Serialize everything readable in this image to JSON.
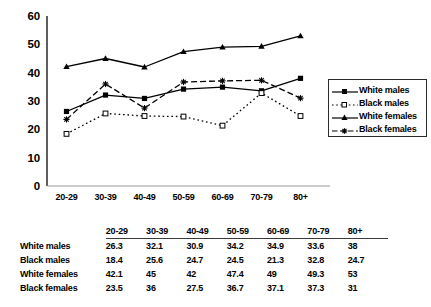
{
  "chart_data": {
    "type": "line",
    "title": "",
    "xlabel": "",
    "ylabel": "",
    "ylim": [
      0,
      60
    ],
    "yticks": [
      0,
      10,
      20,
      30,
      40,
      50,
      60
    ],
    "grid": false,
    "legend_position": "right",
    "categories": [
      "20-29",
      "30-39",
      "40-49",
      "50-59",
      "60-69",
      "70-79",
      "80+"
    ],
    "series": [
      {
        "name": "White males",
        "marker": "filled-square",
        "line_style": "solid",
        "values": [
          26.3,
          32.1,
          30.9,
          34.2,
          34.9,
          33.6,
          38
        ]
      },
      {
        "name": "Black males",
        "marker": "open-square",
        "line_style": "dotted",
        "values": [
          18.4,
          25.6,
          24.7,
          24.5,
          21.3,
          32.8,
          24.7
        ]
      },
      {
        "name": "White females",
        "marker": "filled-triangle",
        "line_style": "solid",
        "values": [
          42.1,
          45,
          42,
          47.4,
          49,
          49.3,
          53
        ]
      },
      {
        "name": "Black females",
        "marker": "star",
        "line_style": "dashed",
        "values": [
          23.5,
          36,
          27.5,
          36.7,
          37.1,
          37.3,
          31
        ]
      }
    ]
  },
  "legend": {
    "items": [
      {
        "label": "White males"
      },
      {
        "label": "Black males"
      },
      {
        "label": "White females"
      },
      {
        "label": "Black females"
      }
    ]
  },
  "table": {
    "corner_label": "",
    "columns": [
      "20-29",
      "30-39",
      "40-49",
      "50-59",
      "60-69",
      "70-79",
      "80+"
    ],
    "rows": [
      {
        "label": "White males",
        "values": [
          "26.3",
          "32.1",
          "30.9",
          "34.2",
          "34.9",
          "33.6",
          "38"
        ]
      },
      {
        "label": "Black males",
        "values": [
          "18.4",
          "25.6",
          "24.7",
          "24.5",
          "21.3",
          "32.8",
          "24.7"
        ]
      },
      {
        "label": "White females",
        "values": [
          "42.1",
          "45",
          "42",
          "47.4",
          "49",
          "49.3",
          "53"
        ]
      },
      {
        "label": "Black females",
        "values": [
          "23.5",
          "36",
          "27.5",
          "36.7",
          "37.1",
          "37.3",
          "31"
        ]
      }
    ]
  },
  "colors": {
    "ink": "#000000",
    "axis": "#1a1a1a",
    "rule": "#3a3a3a",
    "background": "#ffffff"
  }
}
